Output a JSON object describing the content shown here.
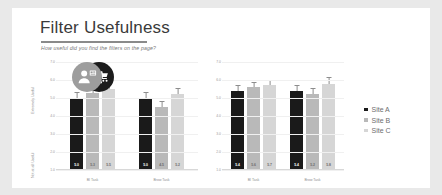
{
  "slide": {
    "title": "Filter Usefulness",
    "subtitle": "How useful did you find the filters on the page?"
  },
  "legend": {
    "items": [
      {
        "label": "Site A",
        "color": "#1a1a1a"
      },
      {
        "label": "Site B",
        "color": "#b9b9b9"
      },
      {
        "label": "Site C",
        "color": "#d6d6d6"
      }
    ]
  },
  "personas": [
    {
      "name": "shopper-persona-icon",
      "circle_color": "#1c1c1c"
    },
    {
      "name": "browser-persona-icon",
      "circle_color": "#9d9d9d"
    }
  ],
  "axis": {
    "top_label": "Extremely Useful",
    "bottom_label": "Not at all Useful",
    "ticks": [
      "7.0",
      "6.0",
      "5.0",
      "4.0",
      "3.0",
      "2.0",
      "1.0"
    ]
  },
  "chart_data": {
    "type": "bar",
    "title": "Filter Usefulness",
    "subtitle": "How useful did you find the filters on the page?",
    "xlabel": "",
    "ylabel": "Usefulness rating",
    "ylim": [
      1.0,
      7.0
    ],
    "grid": true,
    "legend_position": "right",
    "panels": [
      {
        "persona": "shopper-persona-icon",
        "categories": [
          "BI Task",
          "Brow Task"
        ],
        "series": [
          {
            "name": "Site A",
            "color": "#1a1a1a",
            "values": [
              5.0,
              5.0
            ],
            "errors": [
              0.3,
              0.3
            ],
            "labels": [
              "5.0",
              "5.0"
            ]
          },
          {
            "name": "Site B",
            "color": "#b9b9b9",
            "values": [
              5.3,
              4.5
            ],
            "errors": [
              0.3,
              0.3
            ],
            "labels": [
              "5.3",
              "4.5"
            ]
          },
          {
            "name": "Site C",
            "color": "#d6d6d6",
            "values": [
              5.5,
              5.2
            ],
            "errors": [
              0.3,
              0.3
            ],
            "labels": [
              "5.5",
              "5.2"
            ]
          }
        ]
      },
      {
        "persona": "browser-persona-icon",
        "categories": [
          "BI Task",
          "Brow Task"
        ],
        "series": [
          {
            "name": "Site A",
            "color": "#1a1a1a",
            "values": [
              5.4,
              5.4
            ],
            "errors": [
              0.3,
              0.3
            ],
            "labels": [
              "5.4",
              "5.4"
            ]
          },
          {
            "name": "Site B",
            "color": "#b9b9b9",
            "values": [
              5.6,
              5.2
            ],
            "errors": [
              0.25,
              0.3
            ],
            "labels": [
              "5.6",
              "5.2"
            ]
          },
          {
            "name": "Site C",
            "color": "#d6d6d6",
            "values": [
              5.7,
              5.8
            ],
            "errors": [
              0.25,
              0.3
            ],
            "labels": [
              "5.7",
              "5.8"
            ]
          }
        ]
      }
    ]
  }
}
